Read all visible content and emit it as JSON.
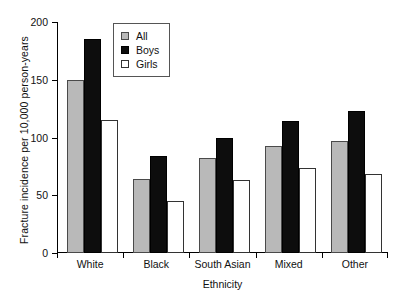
{
  "chart_data": {
    "type": "bar",
    "title": "",
    "subtitle": "",
    "xlabel": "Ethnicity",
    "ylabel": "Fracture incidence per 10,000 person-years",
    "categories": [
      "White",
      "Black",
      "South Asian",
      "Mixed",
      "Other"
    ],
    "series": [
      {
        "name": "All",
        "values": [
          150,
          64,
          82,
          93,
          97
        ],
        "color": "#b9b9b9"
      },
      {
        "name": "Boys",
        "values": [
          185,
          84,
          100,
          114,
          123
        ],
        "color": "#0d0d0d"
      },
      {
        "name": "Girls",
        "values": [
          115,
          45,
          63,
          74,
          68
        ],
        "color": "#ffffff"
      }
    ],
    "ylim": [
      0,
      200
    ],
    "yticks": [
      0,
      50,
      100,
      150,
      200
    ],
    "ytick_labels": [
      "0",
      "50",
      "100",
      "150",
      "200"
    ],
    "grid": false,
    "legend_position": "top-center",
    "legend_entries": [
      "All",
      "Boys",
      "Girls"
    ],
    "bar_group_gap": true,
    "axis_color": "#000000"
  }
}
